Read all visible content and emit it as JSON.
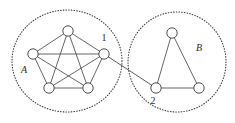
{
  "figure": {
    "width": 235,
    "height": 123,
    "background": "#ffffff",
    "line_color": "#4a4a4a",
    "node_fill": "#ffffff",
    "node_stroke": "#3a3a3a",
    "boundary_color": "#3a3a3a",
    "text_color": "#2b2b2b"
  },
  "clusters": [
    {
      "id": "A",
      "label": "A",
      "label_x": 24,
      "label_y": 73,
      "boundary": {
        "cx": 67,
        "cy": 61,
        "rx": 55,
        "ry": 51
      },
      "node_radius": 5.2,
      "nodes": [
        {
          "id": "a1",
          "x": 68,
          "y": 31
        },
        {
          "id": "a2",
          "x": 33,
          "y": 54
        },
        {
          "id": "a3",
          "x": 104,
          "y": 54
        },
        {
          "id": "a4",
          "x": 49,
          "y": 88
        },
        {
          "id": "a5",
          "x": 88,
          "y": 88
        }
      ],
      "edges": [
        [
          "a1",
          "a2"
        ],
        [
          "a1",
          "a3"
        ],
        [
          "a1",
          "a4"
        ],
        [
          "a1",
          "a5"
        ],
        [
          "a2",
          "a3"
        ],
        [
          "a2",
          "a4"
        ],
        [
          "a2",
          "a5"
        ],
        [
          "a3",
          "a4"
        ],
        [
          "a3",
          "a5"
        ],
        [
          "a4",
          "a5"
        ]
      ]
    },
    {
      "id": "B",
      "label": "B",
      "label_x": 199,
      "label_y": 51,
      "boundary": {
        "cx": 177,
        "cy": 62,
        "rx": 49,
        "ry": 50
      },
      "node_radius": 5.2,
      "nodes": [
        {
          "id": "b1",
          "x": 172,
          "y": 33
        },
        {
          "id": "b2",
          "x": 156,
          "y": 88
        },
        {
          "id": "b3",
          "x": 199,
          "y": 88
        }
      ],
      "edges": [
        [
          "b1",
          "b2"
        ],
        [
          "b1",
          "b3"
        ],
        [
          "b2",
          "b3"
        ]
      ]
    }
  ],
  "bridge": {
    "from": "a3",
    "to": "b2",
    "x1": 104,
    "y1": 54,
    "x2": 156,
    "y2": 88
  },
  "node_labels": [
    {
      "id": "label-1",
      "text": "1",
      "x": 104,
      "y": 41,
      "anchor": "middle"
    },
    {
      "id": "label-2",
      "text": "2",
      "x": 153,
      "y": 104,
      "anchor": "middle"
    }
  ]
}
